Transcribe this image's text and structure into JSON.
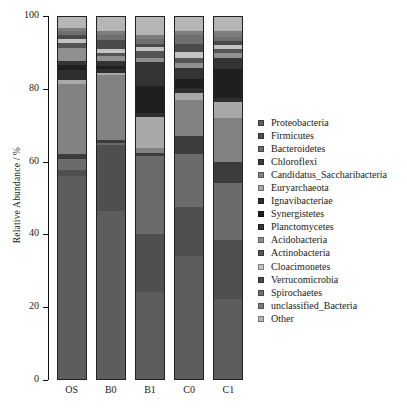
{
  "chart_data": {
    "type": "bar",
    "stacked": true,
    "title": "",
    "xlabel": "",
    "ylabel": "Relative Abundance / %",
    "ylim": [
      0,
      100
    ],
    "yticks": [
      0,
      20,
      40,
      60,
      80,
      100
    ],
    "ytick_labels": [
      "0",
      "20",
      "40",
      "60",
      "80",
      "100"
    ],
    "grid": false,
    "legend_position": "right",
    "categories": [
      "OS",
      "B0",
      "B1",
      "C0",
      "C1"
    ],
    "series": [
      {
        "name": "Proteobacteria",
        "color": "#5d5d5d",
        "values": [
          56.0,
          46.5,
          24.0,
          34.0,
          22.0
        ]
      },
      {
        "name": "Firmicutes",
        "color": "#4f4f4f",
        "values": [
          1.6,
          18.0,
          16.0,
          13.5,
          16.5
        ]
      },
      {
        "name": "Bacteroidetes",
        "color": "#6b6b6b",
        "values": [
          3.2,
          0.8,
          21.5,
          14.5,
          15.5
        ]
      },
      {
        "name": "Chloroflexi",
        "color": "#3c3c3c",
        "values": [
          1.3,
          0.7,
          0.8,
          5.0,
          6.0
        ]
      },
      {
        "name": "Candidatus_Saccharibacteria",
        "color": "#828282",
        "values": [
          19.4,
          18.0,
          1.5,
          10.0,
          12.0
        ]
      },
      {
        "name": "Euryarchaeota",
        "color": "#a8a8a8",
        "values": [
          1.2,
          0.5,
          8.5,
          2.0,
          4.5
        ]
      },
      {
        "name": "Ignavibacteriae",
        "color": "#2e2e2e",
        "values": [
          2.6,
          1.0,
          1.2,
          1.3,
          1.0
        ]
      },
      {
        "name": "Synergistetes",
        "color": "#1f1f1f",
        "values": [
          1.4,
          1.0,
          7.5,
          2.5,
          8.0
        ]
      },
      {
        "name": "Planctomycetes",
        "color": "#343434",
        "values": [
          1.0,
          1.2,
          6.5,
          3.0,
          3.2
        ]
      },
      {
        "name": "Acidobacteria",
        "color": "#909090",
        "values": [
          3.6,
          1.4,
          1.2,
          1.6,
          1.3
        ]
      },
      {
        "name": "Actinobacteria",
        "color": "#555555",
        "values": [
          1.5,
          1.0,
          2.0,
          1.4,
          1.2
        ]
      },
      {
        "name": "Cloacimonetes",
        "color": "#c4c4c4",
        "values": [
          1.0,
          1.1,
          0.9,
          1.6,
          1.1
        ]
      },
      {
        "name": "Verrucomicrobia",
        "color": "#4a4a4a",
        "values": [
          1.2,
          2.4,
          1.0,
          2.2,
          1.0
        ]
      },
      {
        "name": "Spirochaetes",
        "color": "#6f6f6f",
        "values": [
          1.0,
          1.4,
          1.2,
          2.4,
          1.2
        ]
      },
      {
        "name": "unclassified_Bacteria",
        "color": "#7d7d7d",
        "values": [
          1.0,
          1.0,
          1.2,
          1.0,
          1.5
        ]
      },
      {
        "name": "Other",
        "color": "#b5b5b5",
        "values": [
          3.0,
          4.0,
          5.0,
          4.0,
          4.0
        ]
      }
    ]
  },
  "legend": {
    "items": [
      {
        "label": "Proteobacteria",
        "color": "#5d5d5d"
      },
      {
        "label": "Firmicutes",
        "color": "#4f4f4f"
      },
      {
        "label": "Bacteroidetes",
        "color": "#6b6b6b"
      },
      {
        "label": "Chloroflexi",
        "color": "#3c3c3c"
      },
      {
        "label": "Candidatus_Saccharibacteria",
        "color": "#828282"
      },
      {
        "label": "Euryarchaeota",
        "color": "#a8a8a8"
      },
      {
        "label": "Ignavibacteriae",
        "color": "#2e2e2e"
      },
      {
        "label": "Synergistetes",
        "color": "#1f1f1f"
      },
      {
        "label": "Planctomycetes",
        "color": "#343434"
      },
      {
        "label": "Acidobacteria",
        "color": "#909090"
      },
      {
        "label": "Actinobacteria",
        "color": "#555555"
      },
      {
        "label": "Cloacimonetes",
        "color": "#c4c4c4"
      },
      {
        "label": "Verrucomicrobia",
        "color": "#4a4a4a"
      },
      {
        "label": "Spirochaetes",
        "color": "#6f6f6f"
      },
      {
        "label": "unclassified_Bacteria",
        "color": "#7d7d7d"
      },
      {
        "label": "Other",
        "color": "#b5b5b5"
      }
    ]
  }
}
